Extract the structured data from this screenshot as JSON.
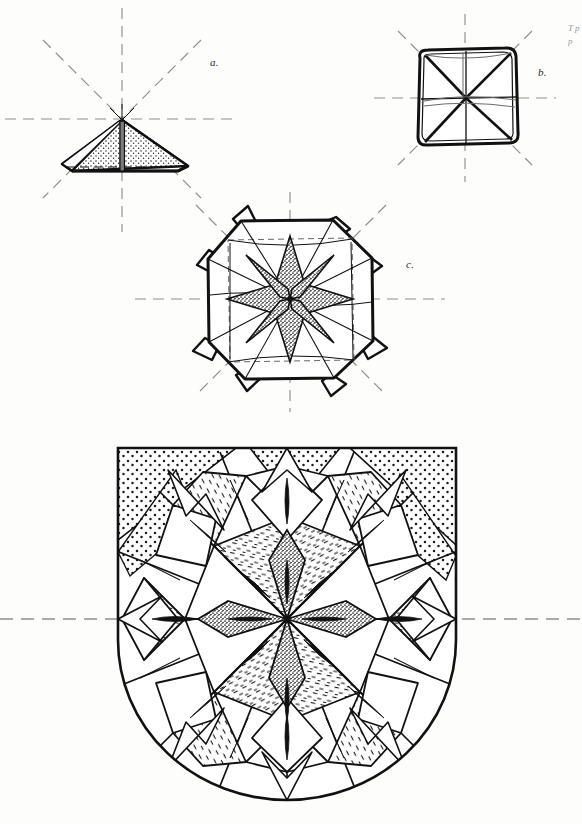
{
  "plate": {
    "title": "Ornamental star / folded-form construction plate",
    "background_color": "#fdfdfb",
    "ink_color": "#1a1a1a",
    "axis_color": "#8a8a8a",
    "stipple_color": "#2b2b2b"
  },
  "figures": [
    {
      "key": "a",
      "label": "a.",
      "label_x": 210,
      "label_y": 56,
      "caption": "single folded triangular unit seen in perspective, with eight radial dash-dot construction axes",
      "center_x": 122,
      "center_y": 119,
      "axis_count": 8,
      "fill": "stipple"
    },
    {
      "key": "b",
      "label": "b.",
      "label_x": 538,
      "label_y": 66,
      "caption": "square assembly of four units with diagonal and median division lines, eight dash-dot axes",
      "center_x": 465,
      "center_y": 98,
      "axis_count": 8,
      "fill": "outline"
    },
    {
      "key": "c",
      "label": "c.",
      "label_x": 406,
      "label_y": 258,
      "caption": "eight-point star rosette with stippled core petals and projecting folded tabs",
      "center_x": 290,
      "center_y": 299,
      "axis_count": 8,
      "fill": "stipple-star"
    },
    {
      "key": "d",
      "label": "",
      "caption": "large shield-shaped composition: sixteen-point radiating star rosette filled with stipple and short-dash hatching, enclosed by a flat-topped, round-bottomed border",
      "center_x": 287,
      "center_y": 619,
      "top_y": 448,
      "bottom_y": 800,
      "left_x": 118,
      "right_x": 456,
      "axis_count": 1,
      "fill": "mixed-hatch"
    }
  ],
  "axis_lines": [
    {
      "name": "axis-horizontal-a",
      "figure": "a",
      "orientation": "horizontal",
      "y": 119
    },
    {
      "name": "axis-horizontal-b",
      "figure": "b",
      "orientation": "horizontal",
      "y": 98
    },
    {
      "name": "axis-horizontal-c",
      "figure": "c",
      "orientation": "horizontal",
      "y": 299
    },
    {
      "name": "axis-horizontal-d",
      "figure": "d",
      "orientation": "horizontal",
      "y": 619
    }
  ],
  "margin_text": {
    "right_edge_fragment": "T\np\np"
  },
  "legend": {
    "stipple": "dotted / stippled shading",
    "dash_hatch": "short-dash hatching",
    "dash_dot_axis": "dash-dot symmetry axis"
  }
}
